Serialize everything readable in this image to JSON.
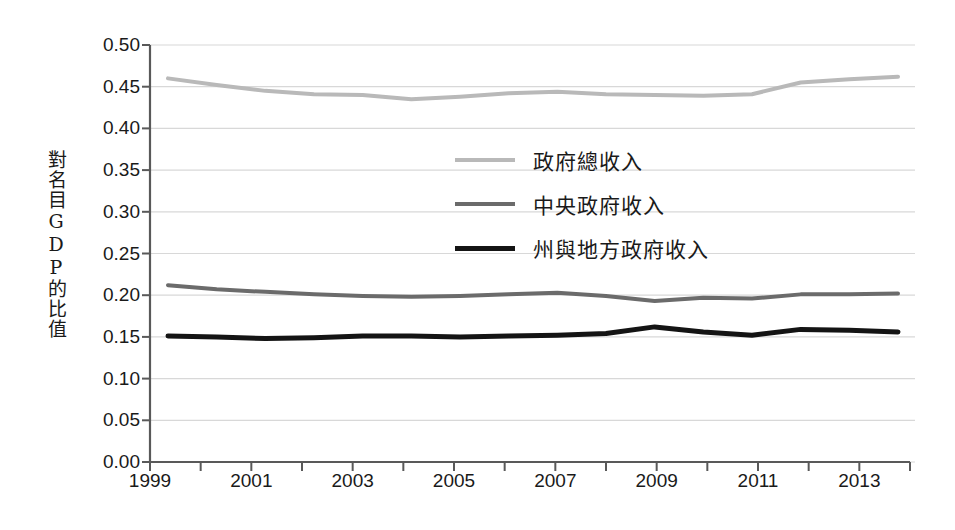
{
  "chart_data": {
    "type": "line",
    "title": "",
    "xlabel": "",
    "ylabel": "對名目GDP的比值",
    "ylabel_chars": [
      "對",
      "名",
      "目",
      "G",
      "D",
      "P",
      "的",
      "比",
      "值"
    ],
    "x": [
      1999,
      2000,
      2001,
      2002,
      2003,
      2004,
      2005,
      2006,
      2007,
      2008,
      2009,
      2010,
      2011,
      2012,
      2013,
      2014
    ],
    "xlim": [
      1999,
      2014
    ],
    "ylim": [
      0.0,
      0.5
    ],
    "ytick_values": [
      0.0,
      0.05,
      0.1,
      0.15,
      0.2,
      0.25,
      0.3,
      0.35,
      0.4,
      0.45,
      0.5
    ],
    "ytick_labels": [
      "0.00",
      "0.05",
      "0.10",
      "0.15",
      "0.20",
      "0.25",
      "0.30",
      "0.35",
      "0.40",
      "0.45",
      "0.50"
    ],
    "xtick_values": [
      1999,
      2000,
      2001,
      2002,
      2003,
      2004,
      2005,
      2006,
      2007,
      2008,
      2009,
      2010,
      2011,
      2012,
      2013,
      2014
    ],
    "xtick_labels_shown": [
      {
        "value": 1999,
        "label": "1999"
      },
      {
        "value": 2001,
        "label": "2001"
      },
      {
        "value": 2003,
        "label": "2003"
      },
      {
        "value": 2005,
        "label": "2005"
      },
      {
        "value": 2007,
        "label": "2007"
      },
      {
        "value": 2009,
        "label": "2009"
      },
      {
        "value": 2011,
        "label": "2011"
      },
      {
        "value": 2013,
        "label": "2013"
      }
    ],
    "grid": "horizontal",
    "legend_position": "center",
    "series": [
      {
        "name": "政府總收入",
        "color": "#b9b9b9",
        "width": 4,
        "values": [
          0.46,
          0.452,
          0.445,
          0.441,
          0.44,
          0.435,
          0.438,
          0.442,
          0.444,
          0.441,
          0.44,
          0.439,
          0.441,
          0.455,
          0.459,
          0.462
        ]
      },
      {
        "name": "中央政府收入",
        "color": "#6b6b6b",
        "width": 4,
        "values": [
          0.212,
          0.207,
          0.204,
          0.201,
          0.199,
          0.198,
          0.199,
          0.201,
          0.203,
          0.199,
          0.193,
          0.197,
          0.196,
          0.201,
          0.201,
          0.202
        ]
      },
      {
        "name": "州與地方政府收入",
        "color": "#141414",
        "width": 5,
        "values": [
          0.151,
          0.15,
          0.148,
          0.149,
          0.151,
          0.151,
          0.15,
          0.151,
          0.152,
          0.154,
          0.162,
          0.156,
          0.152,
          0.159,
          0.158,
          0.156
        ]
      }
    ]
  },
  "plot": {
    "left": 150,
    "right": 910,
    "top": 45,
    "bottom": 462,
    "grid_color": "#d8d8d8",
    "axis_color": "#595959",
    "background": "#ffffff"
  }
}
